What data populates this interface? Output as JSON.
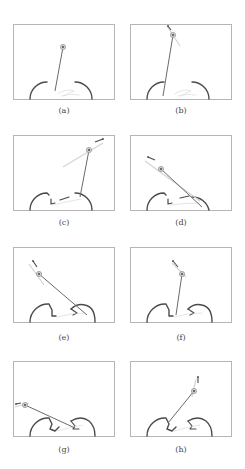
{
  "figure": {
    "panels": [
      {
        "label": "(a)",
        "x": 13,
        "y": 24,
        "cap_y": 106,
        "ball": [
          50,
          23
        ],
        "base": [
          42,
          67
        ],
        "arrow": null,
        "shadow": null,
        "scene": "arcs"
      },
      {
        "label": "(b)",
        "x": 130,
        "y": 24,
        "cap_y": 106,
        "ball": [
          43,
          11
        ],
        "base": [
          33,
          72
        ],
        "arrow": [
          [
            41,
            6
          ],
          [
            38,
            2
          ]
        ],
        "shadow": [
          [
            37,
            2
          ],
          [
            50,
            22
          ]
        ],
        "scene": "arcs"
      },
      {
        "label": "(c)",
        "x": 13,
        "y": 135,
        "cap_y": 218,
        "ball": [
          76,
          15
        ],
        "base": [
          67,
          62
        ],
        "arrow": [
          [
            82,
            7
          ],
          [
            90,
            4
          ]
        ],
        "shadow": [
          [
            50,
            32
          ],
          [
            90,
            8
          ]
        ],
        "scene": "c"
      },
      {
        "label": "(d)",
        "x": 130,
        "y": 135,
        "cap_y": 218,
        "ball": [
          31,
          34
        ],
        "base": [
          72,
          72
        ],
        "arrow": [
          [
            25,
            25
          ],
          [
            18,
            22
          ]
        ],
        "shadow": [
          [
            15,
            26
          ],
          [
            70,
            66
          ]
        ],
        "scene": "d"
      },
      {
        "label": "(e)",
        "x": 13,
        "y": 247,
        "cap_y": 333,
        "ball": [
          26,
          27
        ],
        "base": [
          74,
          68
        ],
        "arrow": [
          [
            24,
            20
          ],
          [
            20,
            14
          ]
        ],
        "shadow": [
          [
            16,
            17
          ],
          [
            31,
            38
          ]
        ],
        "scene": "e"
      },
      {
        "label": "(f)",
        "x": 130,
        "y": 247,
        "cap_y": 333,
        "ball": [
          52,
          27
        ],
        "base": [
          46,
          68
        ],
        "arrow": [
          [
            48,
            20
          ],
          [
            43,
            14
          ]
        ],
        "shadow": [
          [
            42,
            16
          ],
          [
            56,
            30
          ]
        ],
        "scene": "e"
      },
      {
        "label": "(g)",
        "x": 13,
        "y": 361,
        "cap_y": 445,
        "ball": [
          12,
          44
        ],
        "base": [
          62,
          67
        ],
        "arrow": [
          [
            8,
            42
          ],
          [
            3,
            43
          ]
        ],
        "shadow": [
          [
            2,
            46
          ],
          [
            16,
            42
          ]
        ],
        "scene": "g"
      },
      {
        "label": "(h)",
        "x": 130,
        "y": 361,
        "cap_y": 445,
        "ball": [
          64,
          30
        ],
        "base": [
          38,
          62
        ],
        "arrow": [
          [
            68,
            22
          ],
          [
            68,
            16
          ]
        ],
        "shadow": [
          [
            66,
            18
          ],
          [
            62,
            36
          ]
        ],
        "scene": "g"
      }
    ]
  },
  "colors": {
    "frame": "#b5b5b5",
    "ink": "#4a4a4a",
    "rod": "#6a6a6a",
    "ball": "#9a9a9a",
    "faint": "#d4d4d4"
  }
}
